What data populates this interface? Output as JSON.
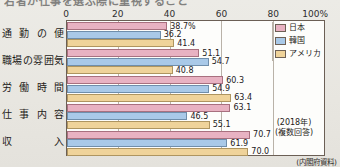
{
  "figure": {
    "headline_clipped": "若者が仕事を選ぶ際に重視すること",
    "source_note": "(内閣府資料)"
  },
  "note_box": {
    "line1": "(2018年)",
    "line2": "(複数回答)"
  },
  "legend": {
    "items": [
      {
        "key": "jp",
        "label": "日本",
        "color": "#e8b2c2"
      },
      {
        "key": "kr",
        "label": "韓国",
        "color": "#a9c9e8"
      },
      {
        "key": "us",
        "label": "アメリカ",
        "color": "#efd39a"
      }
    ]
  },
  "chart_data": {
    "type": "bar",
    "orientation": "horizontal",
    "title": "",
    "xlabel": "",
    "ylabel": "",
    "xlim": [
      0,
      100
    ],
    "xticks": [
      "0",
      "20",
      "40",
      "60",
      "80",
      "100%"
    ],
    "xtick_values": [
      0,
      20,
      40,
      60,
      80,
      100
    ],
    "grid": true,
    "legend_position": "top-right",
    "categories": [
      "通勤の便",
      "職場の雰囲気",
      "労働時間",
      "仕事内容",
      "収　　入"
    ],
    "series": [
      {
        "name": "日本",
        "key": "jp",
        "color": "#e8b2c2",
        "values": [
          38.7,
          51.1,
          60.3,
          63.1,
          70.7
        ]
      },
      {
        "name": "韓国",
        "key": "kr",
        "color": "#a9c9e8",
        "values": [
          36.2,
          54.7,
          54.9,
          46.5,
          61.9
        ]
      },
      {
        "name": "アメリカ",
        "key": "us",
        "color": "#efd39a",
        "values": [
          41.4,
          40.8,
          63.4,
          55.1,
          70.0
        ]
      }
    ],
    "data_labels": [
      [
        "38.7%",
        "36.2",
        "41.4"
      ],
      [
        "51.1",
        "54.7",
        "40.8"
      ],
      [
        "60.3",
        "54.9",
        "63.4"
      ],
      [
        "63.1",
        "46.5",
        "55.1"
      ],
      [
        "70.7",
        "61.9",
        "70.0"
      ]
    ],
    "annotations": [
      "(2018年)",
      "(複数回答)",
      "(内閣府資料)"
    ]
  }
}
